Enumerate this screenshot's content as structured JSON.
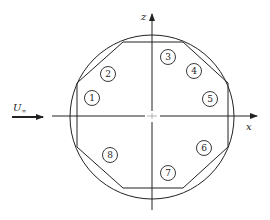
{
  "diagram": {
    "type": "cross-section",
    "axes": {
      "horizontal_label": "x",
      "vertical_label": "z"
    },
    "freestream": {
      "label_main": "U",
      "label_sub": "∞"
    },
    "probes": [
      {
        "id": "1",
        "label": "1",
        "cx": 92,
        "cy": 98
      },
      {
        "id": "2",
        "label": "2",
        "cx": 108,
        "cy": 74
      },
      {
        "id": "3",
        "label": "3",
        "cx": 168,
        "cy": 57
      },
      {
        "id": "4",
        "label": "4",
        "cx": 194,
        "cy": 71
      },
      {
        "id": "5",
        "label": "5",
        "cx": 210,
        "cy": 99
      },
      {
        "id": "6",
        "label": "6",
        "cx": 204,
        "cy": 148
      },
      {
        "id": "7",
        "label": "7",
        "cx": 168,
        "cy": 173
      },
      {
        "id": "8",
        "label": "8",
        "cx": 110,
        "cy": 155
      }
    ],
    "colors": {
      "stroke": "#222222",
      "background": "#ffffff"
    }
  }
}
